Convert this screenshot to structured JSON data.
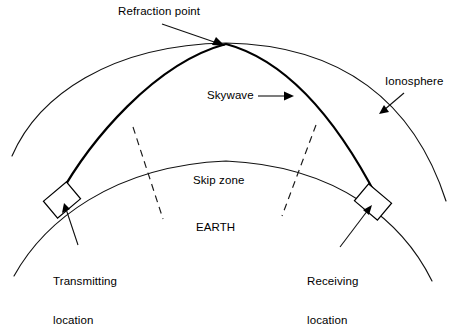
{
  "figure": {
    "background_color": "#ffffff",
    "line_color": "#000000"
  },
  "labels": {
    "refraction_point": "Refraction point",
    "skywave": "Skywave",
    "ionosphere": "Ionosphere",
    "skip_zone": "Skip zone",
    "earth": "EARTH",
    "transmitting_line1": "Transmitting",
    "transmitting_line2": "location",
    "receiving_line1": "Receiving",
    "receiving_line2": "location"
  },
  "elements": {
    "ionosphere_arc": "outer thin arc representing the ionosphere layer",
    "earth_arc": "lower thin arc representing the curved surface of the earth",
    "skywave_path": "heavy arc from transmitting location up to refraction point and down to receiving location",
    "skip_zone_boundary_left": "dashed radial line marking left edge of skip zone",
    "skip_zone_boundary_right": "dashed radial line marking right edge of skip zone",
    "transmitting_station": "tilted rectangle on earth surface at left",
    "receiving_station": "tilted rectangle on earth surface at right"
  },
  "icons": {
    "refraction_arrow": "arrow-icon",
    "skywave_arrow": "arrow-icon",
    "ionosphere_arrow": "arrow-icon",
    "transmitting_arrow": "arrow-icon",
    "receiving_arrow": "arrow-icon"
  }
}
